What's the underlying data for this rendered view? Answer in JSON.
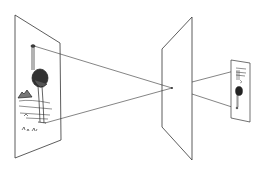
{
  "diagram": {
    "title": "Pinhole camera projection",
    "colors": {
      "line": "#333333",
      "background": "#ffffff",
      "ink": "#222222"
    },
    "planes": [
      {
        "name": "object-plane",
        "points": [
          [
            15,
            15
          ],
          [
            60,
            43
          ],
          [
            61,
            140
          ],
          [
            15,
            158
          ]
        ]
      },
      {
        "name": "pinhole-plane",
        "points": [
          [
            192,
            17
          ],
          [
            162,
            49
          ],
          [
            162,
            127
          ],
          [
            192,
            160
          ]
        ]
      },
      {
        "name": "image-plane",
        "points": [
          [
            231,
            60
          ],
          [
            250,
            63
          ],
          [
            250,
            122
          ],
          [
            231,
            118
          ]
        ]
      }
    ],
    "pinhole": [
      172,
      88
    ],
    "rays": [
      {
        "name": "ray-head",
        "from": [
          33,
          46
        ],
        "via": [
          172,
          88
        ],
        "to": [
          233,
          108
        ]
      },
      {
        "name": "ray-feet",
        "from": [
          44,
          123
        ],
        "via": [
          172,
          88
        ],
        "to": [
          236,
          70
        ]
      }
    ]
  }
}
